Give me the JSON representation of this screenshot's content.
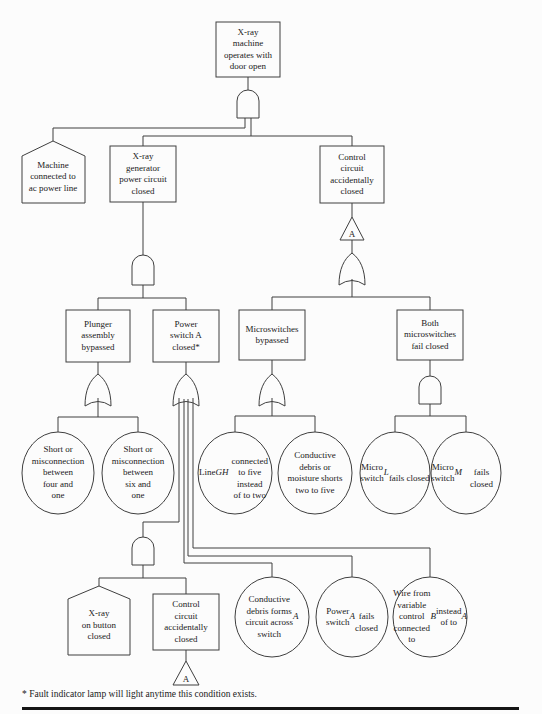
{
  "colors": {
    "line": "#3f3f3f",
    "text": "#1a1a1a",
    "background": "#fcfcfc",
    "rule": "#151515"
  },
  "footnote": "* Fault indicator lamp will light anytime this condition exists.",
  "transfers": {
    "source": {
      "label": "A"
    },
    "destination": {
      "label": "A"
    }
  },
  "gates": [
    {
      "id": "g1",
      "type": "AND",
      "below": "top_event"
    },
    {
      "id": "g2",
      "type": "AND",
      "below": "xray_generator"
    },
    {
      "id": "g3",
      "type": "OR",
      "below": "control_circuit_transfer"
    },
    {
      "id": "g4",
      "type": "OR",
      "below": "plunger_assembly"
    },
    {
      "id": "g5",
      "type": "OR",
      "below": "power_switch_a"
    },
    {
      "id": "g6",
      "type": "OR",
      "below": "microswitches_bypassed"
    },
    {
      "id": "g7",
      "type": "AND",
      "below": "both_microswitches"
    },
    {
      "id": "g8",
      "type": "AND",
      "below": "power_switch_a_input_1"
    }
  ],
  "nodes": {
    "top_event": {
      "shape": "rectangle",
      "label": "X-ray\nmachine\noperates with\ndoor open"
    },
    "machine_connected": {
      "shape": "house",
      "label": "Machine\nconnected to\nac power line"
    },
    "xray_generator": {
      "shape": "rectangle",
      "label": "X-ray\ngenerator\npower circuit\nclosed"
    },
    "control_circuit": {
      "shape": "rectangle",
      "label": "Control\ncircuit\naccidentally\nclosed"
    },
    "plunger_assembly": {
      "shape": "rectangle",
      "label": "Plunger\nassembly\nbypassed"
    },
    "power_switch_a": {
      "shape": "rectangle",
      "label": "Power\nswitch A\nclosed*"
    },
    "microswitches_bypassed": {
      "shape": "rectangle",
      "label": "Microswitches\nbypassed"
    },
    "both_microswitches": {
      "shape": "rectangle",
      "label": "Both\nmicroswitches\nfail closed"
    },
    "short_four_one": {
      "shape": "circle",
      "label": "Short or\nmisconnection\nbetween\nfour and\none"
    },
    "short_six_one": {
      "shape": "circle",
      "label": "Short or\nmisconnection\nbetween\nsix and\none"
    },
    "line_gh": {
      "shape": "circle",
      "label": "Line _GH_\nconnected\nto five instead\nof to two"
    },
    "conductive_moisture": {
      "shape": "circle",
      "label": "Conductive\ndebris or\nmoisture shorts\ntwo to five"
    },
    "micro_switch_l": {
      "shape": "circle",
      "label": "Micro\nswitch\n_L_\nfails closed"
    },
    "micro_switch_m": {
      "shape": "circle",
      "label": "Micro\nswitch\n_M_\nfails closed"
    },
    "xray_on_button": {
      "shape": "house",
      "label": "X-ray\non button\nclosed"
    },
    "control_circuit_2": {
      "shape": "rectangle",
      "label": "Control\ncircuit\naccidentally\nclosed"
    },
    "conductive_forms": {
      "shape": "circle",
      "label": "Conductive\ndebris forms\ncircuit across\nswitch _A_"
    },
    "power_switch_fails": {
      "shape": "circle",
      "label": "Power\nswitch _A_\nfails\nclosed"
    },
    "wire_variable": {
      "shape": "circle",
      "label": "Wire from\nvariable control\nconnected to\n_B_ instead\nof to _A_"
    }
  }
}
